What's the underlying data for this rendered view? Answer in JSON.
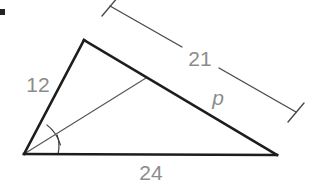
{
  "figure": {
    "type": "geometry-diagram",
    "background_color": "#ffffff",
    "stroke_color": "#1d1d1d",
    "thin_stroke_color": "#5a5a5a",
    "dimension_color": "#4a4a4a",
    "label_color": "#8c8c8c",
    "labels": {
      "side_left": "12",
      "dimension_top": "21",
      "segment": "p",
      "side_base": "24"
    },
    "geometry": {
      "vertex_apex": [
        84,
        40
      ],
      "vertex_bottom_left": [
        24,
        154
      ],
      "vertex_bottom_right": [
        277,
        155
      ],
      "cevian_foot": [
        146,
        78
      ],
      "dimension_line_start": [
        110,
        6
      ],
      "dimension_line_end": [
        296,
        112
      ],
      "angle_arc_count": 2
    }
  }
}
